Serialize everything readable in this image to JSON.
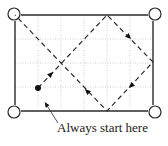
{
  "diagram": {
    "type": "billiard-table-ball-path",
    "caption": "Always start here",
    "colors": {
      "line": "#2a2a2a",
      "grid": "#bdbdbd",
      "background": "#ffffff",
      "ball": "#111111"
    },
    "table": {
      "left": 15,
      "top": 15,
      "right": 153,
      "bottom": 111,
      "grid_columns": 6,
      "grid_rows": 4
    },
    "pockets": [
      {
        "name": "top-left",
        "cx": 14,
        "cy": 14,
        "r": 6
      },
      {
        "name": "top-right",
        "cx": 155,
        "cy": 14,
        "r": 6
      },
      {
        "name": "bottom-left",
        "cx": 14,
        "cy": 112,
        "r": 6
      },
      {
        "name": "bottom-right",
        "cx": 155,
        "cy": 112,
        "r": 6
      }
    ],
    "ball": {
      "cx": 38,
      "cy": 88,
      "r": 3
    },
    "path": [
      {
        "x": 38,
        "y": 88
      },
      {
        "x": 107,
        "y": 15
      },
      {
        "x": 153,
        "y": 62
      },
      {
        "x": 107,
        "y": 111
      },
      {
        "x": 15,
        "y": 15
      }
    ],
    "arrows": [
      {
        "x": 51,
        "y": 74,
        "dir": "up-right"
      },
      {
        "x": 129,
        "y": 37,
        "dir": "down-right"
      },
      {
        "x": 131,
        "y": 86,
        "dir": "down-left"
      },
      {
        "x": 87,
        "y": 91,
        "dir": "up-left"
      }
    ],
    "leader": {
      "from": {
        "x": 58,
        "y": 123
      },
      "to": {
        "x": 46,
        "y": 104
      }
    }
  }
}
